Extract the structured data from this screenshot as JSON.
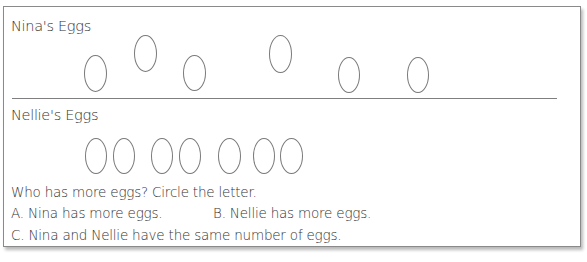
{
  "worksheet": {
    "section_nina": {
      "title": "Nina's Eggs",
      "egg_count": 6,
      "eggs": [
        {
          "x": 80,
          "y": 48,
          "w": 23,
          "h": 37
        },
        {
          "x": 130,
          "y": 28,
          "w": 23,
          "h": 37
        },
        {
          "x": 179,
          "y": 48,
          "w": 23,
          "h": 36
        },
        {
          "x": 265,
          "y": 28,
          "w": 23,
          "h": 38
        },
        {
          "x": 334,
          "y": 50,
          "w": 22,
          "h": 36
        },
        {
          "x": 403,
          "y": 50,
          "w": 22,
          "h": 36
        }
      ]
    },
    "section_nellie": {
      "title": "Nellie's Eggs",
      "egg_count": 7,
      "eggs": [
        {
          "x": 81,
          "y": 131,
          "w": 22,
          "h": 36
        },
        {
          "x": 109,
          "y": 131,
          "w": 22,
          "h": 36
        },
        {
          "x": 147,
          "y": 131,
          "w": 22,
          "h": 36
        },
        {
          "x": 175,
          "y": 131,
          "w": 22,
          "h": 36
        },
        {
          "x": 214,
          "y": 131,
          "w": 23,
          "h": 36
        },
        {
          "x": 249,
          "y": 131,
          "w": 22,
          "h": 36
        },
        {
          "x": 276,
          "y": 131,
          "w": 23,
          "h": 36
        }
      ]
    },
    "question": {
      "prompt": "Who has more eggs? Circle the letter.",
      "options": [
        {
          "letter": "A",
          "label": "A.  Nina has more eggs."
        },
        {
          "letter": "B",
          "label": "B.  Nellie has more eggs."
        },
        {
          "letter": "C",
          "label": "C.  Nina and Nellie have the same number of eggs."
        }
      ]
    }
  }
}
